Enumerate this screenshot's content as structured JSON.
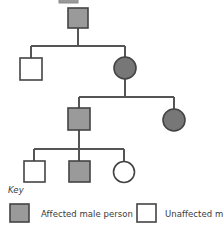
{
  "figure": {
    "type": "pedigree-chart",
    "top_partial_marker": "affected-male-symbol-partial"
  },
  "colors": {
    "affected_fill": "#9a9a9a",
    "unaffected_fill": "#ffffff",
    "stroke": "#444444",
    "line": "#555555",
    "text": "#3a3a3a"
  },
  "generations": [
    {
      "id": "generation-1",
      "individuals": [
        {
          "id": "I-1",
          "shape": "square",
          "sex": "male",
          "status": "affected",
          "x": 78,
          "y": 18,
          "size": 20
        }
      ]
    },
    {
      "id": "generation-2",
      "individuals": [
        {
          "id": "II-1",
          "shape": "square",
          "sex": "male",
          "status": "unaffected",
          "x": 31,
          "y": 69,
          "size": 22
        },
        {
          "id": "II-2",
          "shape": "circle",
          "sex": "female",
          "status": "affected",
          "x": 125,
          "y": 68,
          "size": 22
        }
      ]
    },
    {
      "id": "generation-3",
      "individuals": [
        {
          "id": "III-1",
          "shape": "square",
          "sex": "male",
          "status": "affected",
          "x": 79,
          "y": 119,
          "size": 22
        },
        {
          "id": "III-2",
          "shape": "circle",
          "sex": "female",
          "status": "affected",
          "x": 174,
          "y": 120,
          "size": 22
        }
      ]
    },
    {
      "id": "generation-4",
      "individuals": [
        {
          "id": "IV-1",
          "shape": "square",
          "sex": "male",
          "status": "unaffected",
          "x": 34,
          "y": 171,
          "size": 21
        },
        {
          "id": "IV-2",
          "shape": "square",
          "sex": "male",
          "status": "affected",
          "x": 79,
          "y": 171,
          "size": 21
        },
        {
          "id": "IV-3",
          "shape": "circle",
          "sex": "female",
          "status": "unaffected",
          "x": 124,
          "y": 172,
          "size": 21
        }
      ]
    }
  ],
  "key": {
    "title": "Key",
    "entries": [
      {
        "id": "key-affected-male",
        "label": "Affected male person",
        "swatch": "affected-square",
        "fill": "#9a9a9a"
      },
      {
        "id": "key-unaffected-male",
        "label": "Unaffected male",
        "swatch": "unaffected-square",
        "fill": "#ffffff",
        "truncated": true
      }
    ]
  }
}
